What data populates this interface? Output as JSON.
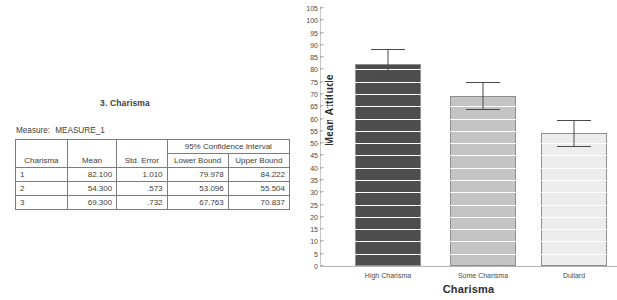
{
  "table": {
    "title": "3. Charisma",
    "measure_label": "Measure:",
    "measure_value": "MEASURE_1",
    "group_header": "95% Confidence Interval",
    "columns": [
      "Charisma",
      "Mean",
      "Std. Error",
      "Lower Bound",
      "Upper Bound"
    ],
    "rows": [
      {
        "charisma": "1",
        "mean": "82.100",
        "std_error": "1.010",
        "lower_bound": "79.978",
        "upper_bound": "84.222"
      },
      {
        "charisma": "2",
        "mean": "54.300",
        "std_error": ".573",
        "lower_bound": "53.096",
        "upper_bound": "55.504"
      },
      {
        "charisma": "3",
        "mean": "69.300",
        "std_error": ".732",
        "lower_bound": "67.763",
        "upper_bound": "70.837"
      }
    ]
  },
  "chart_data": {
    "type": "bar",
    "title": "",
    "xlabel": "Charisma",
    "ylabel": "Mean Attitude",
    "ylim": [
      0,
      105
    ],
    "ytick_step": 5,
    "yticks": [
      "0",
      "5",
      "10",
      "15",
      "20",
      "25",
      "30",
      "35",
      "40",
      "45",
      "50",
      "55",
      "60",
      "65",
      "70",
      "75",
      "80",
      "85",
      "90",
      "95",
      "100",
      "105"
    ],
    "grid": true,
    "legend": "none",
    "categories": [
      "High Charisma",
      "Some Charisma",
      "Dullard"
    ],
    "values": [
      82.1,
      69.3,
      54.3
    ],
    "error_lower": [
      79.978,
      67.763,
      53.096
    ],
    "error_upper": [
      84.222,
      70.837,
      55.504
    ],
    "bar_colors": [
      "#4d4d4d",
      "#c4c4c4",
      "#ededed"
    ],
    "bar_border_color": "#8e8e8e",
    "error_bar_color": "#4a4a4a"
  }
}
